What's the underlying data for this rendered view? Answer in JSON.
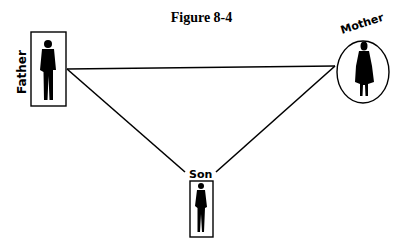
{
  "figure": {
    "title": "Figure 8-4"
  },
  "nodes": [
    {
      "id": "father",
      "label": "Father",
      "shape": "rectangle",
      "gender": "male"
    },
    {
      "id": "mother",
      "label": "Mother",
      "shape": "ellipse",
      "gender": "female"
    },
    {
      "id": "son",
      "label": "Son",
      "shape": "rectangle",
      "gender": "male"
    }
  ],
  "edges": [
    {
      "from": "father",
      "to": "mother"
    },
    {
      "from": "father",
      "to": "son"
    },
    {
      "from": "mother",
      "to": "son"
    }
  ],
  "colors": {
    "line": "#000000",
    "background": "#ffffff"
  }
}
